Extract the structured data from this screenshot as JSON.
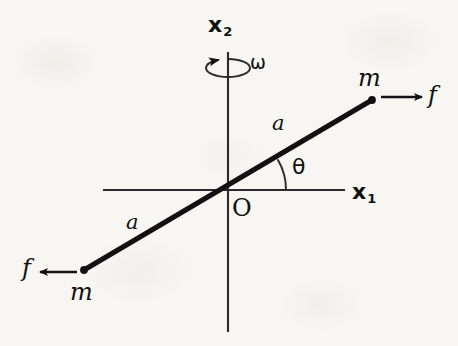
{
  "figure": {
    "kind": "physics-diagram",
    "background_color": "#f7f6f2",
    "ink_color": "#111111"
  },
  "axes": {
    "horizontal": {
      "name": "x1",
      "label_base": "x",
      "label_sub": "1",
      "x_start": 103,
      "x_end": 345,
      "y": 190,
      "label_x": 352,
      "label_y": 181
    },
    "vertical": {
      "name": "x2",
      "label_base": "x",
      "label_sub": "2",
      "x": 228,
      "y_start": 52,
      "y_end": 332,
      "label_x": 208,
      "label_y": 14
    },
    "origin": {
      "label": "O",
      "x": 228,
      "y": 190,
      "label_x": 232,
      "label_y": 196
    }
  },
  "rotation": {
    "symbol": "ω",
    "label_x": 250,
    "label_y": 53,
    "ellipse_cx": 228,
    "ellipse_cy": 68,
    "ellipse_rx": 22,
    "ellipse_ry": 9,
    "arrow_direction": "counterclockwise-left"
  },
  "rod": {
    "angle_deg": 31,
    "upper_end": {
      "x": 372,
      "y": 100
    },
    "lower_end": {
      "x": 84,
      "y": 270
    },
    "stroke_width": 5
  },
  "angle_marker": {
    "symbol": "θ",
    "label_x": 292,
    "label_y": 156,
    "arc_radius": 58
  },
  "arm_labels": [
    {
      "id": "arm-upper",
      "text": "a",
      "x": 272,
      "y": 113
    },
    {
      "id": "arm-lower",
      "text": "a",
      "x": 126,
      "y": 212
    }
  ],
  "masses": [
    {
      "id": "mass-upper",
      "text": "m",
      "x": 358,
      "y": 66,
      "dot_x": 372,
      "dot_y": 100
    },
    {
      "id": "mass-lower",
      "text": "m",
      "x": 70,
      "y": 280,
      "dot_x": 84,
      "dot_y": 270
    }
  ],
  "forces": [
    {
      "id": "force-upper",
      "text": "f",
      "label_x": 428,
      "label_y": 83,
      "arrow_x1": 381,
      "arrow_y1": 97,
      "arrow_x2": 422,
      "arrow_y2": 97,
      "direction": "right"
    },
    {
      "id": "force-lower",
      "text": "f",
      "label_x": 22,
      "label_y": 256,
      "arrow_x1": 77,
      "arrow_y1": 272,
      "arrow_x2": 40,
      "arrow_y2": 272,
      "direction": "left"
    }
  ]
}
